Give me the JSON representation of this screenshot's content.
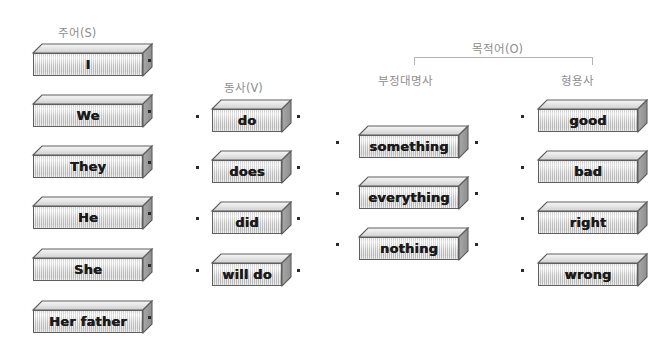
{
  "page": {
    "background_color": "#ffffff",
    "header_text_color": "#8d8d8d",
    "block_face_color": "#d2d2d2",
    "block_side_color": "#9a9a9a",
    "block_outline_color": "#5e5e5e",
    "dot_color": "#2b2b2b",
    "bracket_color": "#b4b4b4"
  },
  "headers": {
    "subject": "주어(S)",
    "verb": "동사(V)",
    "object": "목적어(O)",
    "indefinite_pronoun": "부정대명사",
    "adjective": "형용사"
  },
  "columns": {
    "subject": {
      "label": "주어(S)",
      "items": [
        "I",
        "We",
        "They",
        "He",
        "She",
        "Her father"
      ]
    },
    "verb": {
      "label": "동사(V)",
      "items": [
        "do",
        "does",
        "did",
        "will do"
      ]
    },
    "indefinite_pronoun": {
      "label": "부정대명사",
      "items": [
        "something",
        "everything",
        "nothing"
      ]
    },
    "adjective": {
      "label": "형용사",
      "items": [
        "good",
        "bad",
        "right",
        "wrong"
      ]
    }
  },
  "blocks": [
    {
      "id": "subject-0",
      "text": "I",
      "x": 33,
      "y": 44,
      "w": 110,
      "h": 23,
      "depth": 9
    },
    {
      "id": "subject-1",
      "text": "We",
      "x": 33,
      "y": 95,
      "w": 110,
      "h": 23,
      "depth": 9
    },
    {
      "id": "subject-2",
      "text": "They",
      "x": 33,
      "y": 146,
      "w": 110,
      "h": 23,
      "depth": 9
    },
    {
      "id": "subject-3",
      "text": "He",
      "x": 33,
      "y": 197,
      "w": 110,
      "h": 23,
      "depth": 9
    },
    {
      "id": "subject-4",
      "text": "She",
      "x": 33,
      "y": 249,
      "w": 110,
      "h": 23,
      "depth": 9
    },
    {
      "id": "subject-5",
      "text": "Her father",
      "x": 33,
      "y": 301,
      "w": 110,
      "h": 23,
      "depth": 9
    },
    {
      "id": "verb-0",
      "text": "do",
      "x": 212,
      "y": 100,
      "w": 70,
      "h": 23,
      "depth": 9
    },
    {
      "id": "verb-1",
      "text": "does",
      "x": 212,
      "y": 151,
      "w": 70,
      "h": 23,
      "depth": 9
    },
    {
      "id": "verb-2",
      "text": "did",
      "x": 212,
      "y": 202,
      "w": 70,
      "h": 23,
      "depth": 9
    },
    {
      "id": "verb-3",
      "text": "will do",
      "x": 212,
      "y": 254,
      "w": 70,
      "h": 23,
      "depth": 9
    },
    {
      "id": "pron-0",
      "text": "something",
      "x": 359,
      "y": 126,
      "w": 100,
      "h": 23,
      "depth": 9
    },
    {
      "id": "pron-1",
      "text": "everything",
      "x": 359,
      "y": 177,
      "w": 100,
      "h": 23,
      "depth": 9
    },
    {
      "id": "pron-2",
      "text": "nothing",
      "x": 359,
      "y": 228,
      "w": 100,
      "h": 23,
      "depth": 9
    },
    {
      "id": "adj-0",
      "text": "good",
      "x": 538,
      "y": 100,
      "w": 100,
      "h": 23,
      "depth": 9
    },
    {
      "id": "adj-1",
      "text": "bad",
      "x": 538,
      "y": 151,
      "w": 100,
      "h": 23,
      "depth": 9
    },
    {
      "id": "adj-2",
      "text": "right",
      "x": 538,
      "y": 202,
      "w": 100,
      "h": 23,
      "depth": 9
    },
    {
      "id": "adj-3",
      "text": "wrong",
      "x": 538,
      "y": 254,
      "w": 100,
      "h": 23,
      "depth": 9
    }
  ],
  "dots": [
    {
      "id": "dot-subject-0-right",
      "x": 148,
      "y": 59
    },
    {
      "id": "dot-subject-1-right",
      "x": 148,
      "y": 110
    },
    {
      "id": "dot-subject-2-right",
      "x": 148,
      "y": 161
    },
    {
      "id": "dot-subject-3-right",
      "x": 148,
      "y": 212
    },
    {
      "id": "dot-subject-4-right",
      "x": 148,
      "y": 264
    },
    {
      "id": "dot-subject-5-right",
      "x": 148,
      "y": 316
    },
    {
      "id": "dot-verb-0-left",
      "x": 196,
      "y": 115
    },
    {
      "id": "dot-verb-1-left",
      "x": 196,
      "y": 166
    },
    {
      "id": "dot-verb-2-left",
      "x": 196,
      "y": 217
    },
    {
      "id": "dot-verb-3-left",
      "x": 196,
      "y": 269
    },
    {
      "id": "dot-verb-0-right",
      "x": 297,
      "y": 115
    },
    {
      "id": "dot-verb-1-right",
      "x": 297,
      "y": 166
    },
    {
      "id": "dot-verb-2-right",
      "x": 297,
      "y": 217
    },
    {
      "id": "dot-verb-3-right",
      "x": 297,
      "y": 269
    },
    {
      "id": "dot-pron-0-left",
      "x": 336,
      "y": 141
    },
    {
      "id": "dot-pron-1-left",
      "x": 336,
      "y": 192
    },
    {
      "id": "dot-pron-2-left",
      "x": 336,
      "y": 243
    },
    {
      "id": "dot-pron-0-right",
      "x": 475,
      "y": 141
    },
    {
      "id": "dot-pron-1-right",
      "x": 475,
      "y": 192
    },
    {
      "id": "dot-pron-2-right",
      "x": 475,
      "y": 243
    },
    {
      "id": "dot-adj-0-left",
      "x": 521,
      "y": 115
    },
    {
      "id": "dot-adj-1-left",
      "x": 521,
      "y": 166
    },
    {
      "id": "dot-adj-2-left",
      "x": 521,
      "y": 217
    },
    {
      "id": "dot-adj-3-left",
      "x": 521,
      "y": 269
    }
  ],
  "bracket": {
    "x": 414,
    "y": 57,
    "width": 179,
    "height": 8
  },
  "header_positions": {
    "subject": {
      "x": 58,
      "y": 24
    },
    "verb": {
      "x": 224,
      "y": 79
    },
    "object": {
      "x": 472,
      "y": 40
    },
    "indefinite_pronoun": {
      "x": 378,
      "y": 72
    },
    "adjective": {
      "x": 561,
      "y": 72
    }
  }
}
